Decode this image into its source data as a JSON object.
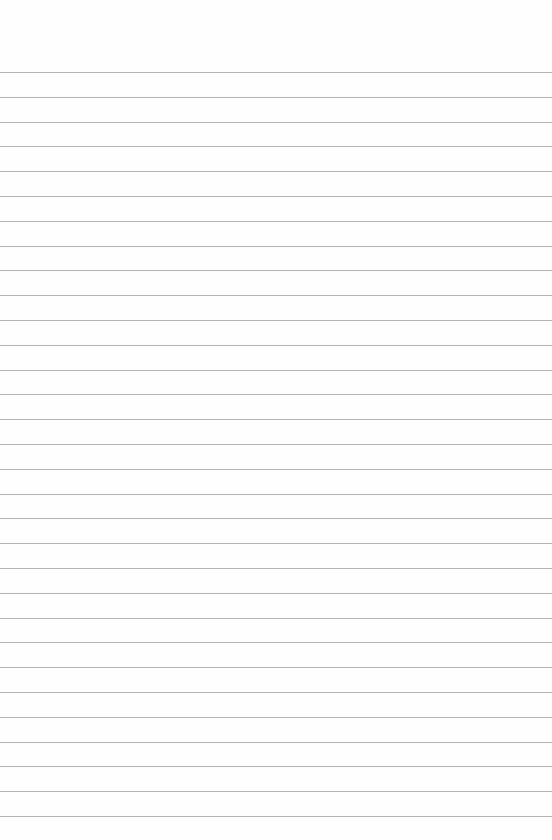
{
  "sheet": {
    "type": "lined-paper",
    "background_color": "#fefefe",
    "line_color": "#b4b4b4",
    "first_line_y": 72,
    "line_spacing": 24.8,
    "line_count": 31
  }
}
